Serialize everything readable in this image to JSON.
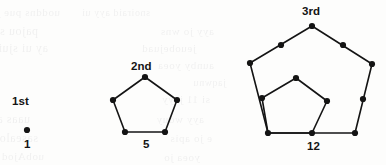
{
  "figure": {
    "title_context": "pentagonal numbers sequence diagram",
    "background_color": "#fdfdfc",
    "ink_color": "#141414",
    "groups": [
      {
        "name": "first-pentagonal-number",
        "ordinal_label": "1st",
        "ordinal_pos": {
          "x": 12,
          "y": 96
        },
        "count_label": "1",
        "count_pos": {
          "x": 24,
          "y": 139
        },
        "dots": [
          {
            "x": 27,
            "y": 130,
            "r": 3.1
          }
        ],
        "edges": []
      },
      {
        "name": "second-pentagonal-number",
        "ordinal_label": "2nd",
        "ordinal_pos": {
          "x": 131,
          "y": 61
        },
        "count_label": "5",
        "count_pos": {
          "x": 143,
          "y": 139
        },
        "dots": [
          {
            "x": 145,
            "y": 77,
            "r": 3.1
          },
          {
            "x": 113,
            "y": 100,
            "r": 3.1
          },
          {
            "x": 177,
            "y": 100,
            "r": 3.1
          },
          {
            "x": 125,
            "y": 132,
            "r": 3.1
          },
          {
            "x": 165,
            "y": 132,
            "r": 3.1
          }
        ],
        "edges": [
          {
            "x1": 145,
            "y1": 77,
            "x2": 113,
            "y2": 100
          },
          {
            "x1": 113,
            "y1": 100,
            "x2": 125,
            "y2": 132
          },
          {
            "x1": 125,
            "y1": 132,
            "x2": 165,
            "y2": 132
          },
          {
            "x1": 165,
            "y1": 132,
            "x2": 177,
            "y2": 100
          },
          {
            "x1": 177,
            "y1": 100,
            "x2": 145,
            "y2": 77
          }
        ]
      },
      {
        "name": "third-pentagonal-number",
        "ordinal_label": "3rd",
        "ordinal_pos": {
          "x": 302,
          "y": 6
        },
        "count_label": "12",
        "count_pos": {
          "x": 307,
          "y": 141
        },
        "dots": [
          {
            "x": 312,
            "y": 26,
            "r": 3.1
          },
          {
            "x": 281,
            "y": 45,
            "r": 3.1
          },
          {
            "x": 343,
            "y": 45,
            "r": 3.1
          },
          {
            "x": 250,
            "y": 63,
            "r": 3.1
          },
          {
            "x": 372,
            "y": 64,
            "r": 3.1
          },
          {
            "x": 262,
            "y": 98,
            "r": 3.1
          },
          {
            "x": 363,
            "y": 99,
            "r": 3.1
          },
          {
            "x": 268,
            "y": 133,
            "r": 3.1
          },
          {
            "x": 355,
            "y": 133,
            "r": 3.1
          },
          {
            "x": 312,
            "y": 133,
            "r": 3.1
          },
          {
            "x": 296,
            "y": 78,
            "r": 3.1
          },
          {
            "x": 327,
            "y": 101,
            "r": 3.1
          }
        ],
        "edges": [
          {
            "x1": 312,
            "y1": 26,
            "x2": 250,
            "y2": 63
          },
          {
            "x1": 250,
            "y1": 63,
            "x2": 268,
            "y2": 133
          },
          {
            "x1": 268,
            "y1": 133,
            "x2": 355,
            "y2": 133
          },
          {
            "x1": 355,
            "y1": 133,
            "x2": 372,
            "y2": 64
          },
          {
            "x1": 372,
            "y1": 64,
            "x2": 312,
            "y2": 26
          },
          {
            "x1": 296,
            "y1": 78,
            "x2": 262,
            "y2": 98
          },
          {
            "x1": 262,
            "y1": 98,
            "x2": 268,
            "y2": 133
          },
          {
            "x1": 268,
            "y1": 133,
            "x2": 312,
            "y2": 133
          },
          {
            "x1": 312,
            "y1": 133,
            "x2": 327,
            "y2": 101
          },
          {
            "x1": 327,
            "y1": 101,
            "x2": 296,
            "y2": 78
          }
        ]
      }
    ],
    "bleed_through_lines": [
      {
        "text": "uoddns pue jay",
        "x": 60,
        "y": 6,
        "size": 11
      },
      {
        "text": "snoiraid ayy ui",
        "x": 150,
        "y": 7,
        "size": 10
      },
      {
        "text": "pajou se suaquinu",
        "x": 38,
        "y": 24,
        "size": 12
      },
      {
        "text": "ayy jo wns",
        "x": 214,
        "y": 25,
        "size": 11
      },
      {
        "text": "ay ui sjuiod",
        "x": 48,
        "y": 41,
        "size": 12
      },
      {
        "text": "jeuobejuad",
        "x": 196,
        "y": 42,
        "size": 11
      },
      {
        "text": "aunby yoea",
        "x": 214,
        "y": 59,
        "size": 11
      },
      {
        "text": "jaqwnu",
        "x": 226,
        "y": 77,
        "size": 10
      },
      {
        "text": "si 11 jeyy",
        "x": 210,
        "y": 93,
        "size": 11
      },
      {
        "text": "uaas aq ues",
        "x": 30,
        "y": 112,
        "size": 12
      },
      {
        "text": "ayy wouy",
        "x": 204,
        "y": 113,
        "size": 11
      },
      {
        "text": "sasealoul",
        "x": 38,
        "y": 131,
        "size": 12
      },
      {
        "text": "e jo apis",
        "x": 212,
        "y": 132,
        "size": 11
      },
      {
        "text": "uobAjod",
        "x": 44,
        "y": 150,
        "size": 11
      },
      {
        "text": "yoea jo",
        "x": 200,
        "y": 151,
        "size": 11
      }
    ]
  }
}
